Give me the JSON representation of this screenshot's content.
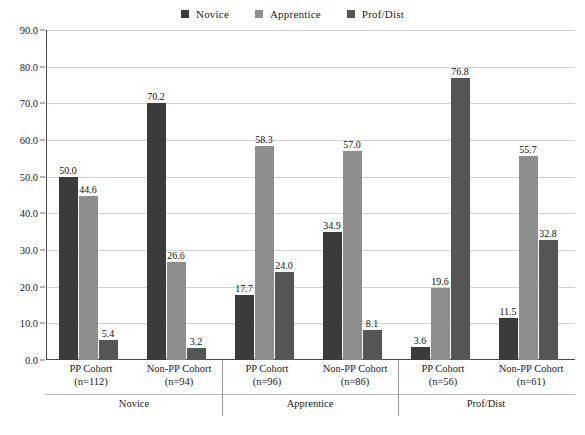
{
  "chart_data": {
    "type": "bar",
    "title": "",
    "subtitle": "",
    "xlabel": "",
    "ylabel": "",
    "ylim": [
      0,
      90
    ],
    "ytick_step": 10,
    "ytick_labels": [
      "0.0",
      "10.0",
      "20.0",
      "30.0",
      "40.0",
      "50.0",
      "60.0",
      "70.0",
      "80.0",
      "90.0"
    ],
    "grid": true,
    "legend_position": "top-center",
    "categories": [
      "PP Cohort (n=112)",
      "Non-PP Cohort (n=94)",
      "PP Cohort (n=96)",
      "Non-PP Cohort (n=86)",
      "PP Cohort (n=56)",
      "Non-PP Cohort (n=61)"
    ],
    "groups": [
      {
        "name": "Novice",
        "cohorts": [
          {
            "label": "PP Cohort",
            "n_label": "(n=112)",
            "values": [
              50.0,
              44.6,
              5.4
            ],
            "value_labels": [
              "50.0",
              "44.6",
              "5.4"
            ]
          },
          {
            "label": "Non-PP Cohort",
            "n_label": "(n=94)",
            "values": [
              70.2,
              26.6,
              3.2
            ],
            "value_labels": [
              "70.2",
              "26.6",
              "3.2"
            ]
          }
        ]
      },
      {
        "name": "Apprentice",
        "cohorts": [
          {
            "label": "PP Cohort",
            "n_label": "(n=96)",
            "values": [
              17.7,
              58.3,
              24.0
            ],
            "value_labels": [
              "17.7",
              "58.3",
              "24.0"
            ]
          },
          {
            "label": "Non-PP Cohort",
            "n_label": "(n=86)",
            "values": [
              34.9,
              57.0,
              8.1
            ],
            "value_labels": [
              "34.9",
              "57.0",
              "8.1"
            ]
          }
        ]
      },
      {
        "name": "Prof/Dist",
        "cohorts": [
          {
            "label": "PP Cohort",
            "n_label": "(n=56)",
            "values": [
              3.6,
              19.6,
              76.8
            ],
            "value_labels": [
              "3.6",
              "19.6",
              "76.8"
            ]
          },
          {
            "label": "Non-PP Cohort",
            "n_label": "(n=61)",
            "values": [
              11.5,
              55.7,
              32.8
            ],
            "value_labels": [
              "11.5",
              "55.7",
              "32.8"
            ]
          }
        ]
      }
    ],
    "series": [
      {
        "name": "Novice",
        "color": "#3b3b3b",
        "values": [
          50.0,
          70.2,
          17.7,
          34.9,
          3.6,
          11.5
        ]
      },
      {
        "name": "Apprentice",
        "color": "#8e8e8e",
        "values": [
          44.6,
          26.6,
          58.3,
          57.0,
          19.6,
          55.7
        ]
      },
      {
        "name": "Prof/Dist",
        "color": "#555555",
        "values": [
          5.4,
          3.2,
          24.0,
          8.1,
          76.8,
          32.8
        ]
      }
    ]
  },
  "legend": {
    "entries": [
      {
        "label": "Novice",
        "color": "#3b3b3b"
      },
      {
        "label": "Apprentice",
        "color": "#8e8e8e"
      },
      {
        "label": "Prof/Dist",
        "color": "#555555"
      }
    ]
  },
  "colors": {
    "novice": "#3b3b3b",
    "apprentice": "#8e8e8e",
    "prof_dist": "#555555",
    "gridline": "#d2d2d2",
    "axis": "#4a4a4a",
    "background": "#ffffff"
  }
}
